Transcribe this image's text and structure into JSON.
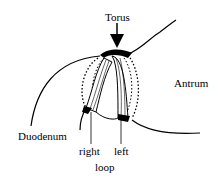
{
  "diagram": {
    "labels": {
      "torus": "Torus",
      "antrum": "Antrum",
      "duodenum": "Duodenum",
      "right": "right",
      "left": "left",
      "loop": "loop"
    },
    "icons": {
      "arrow": "down-arrow-icon"
    }
  }
}
